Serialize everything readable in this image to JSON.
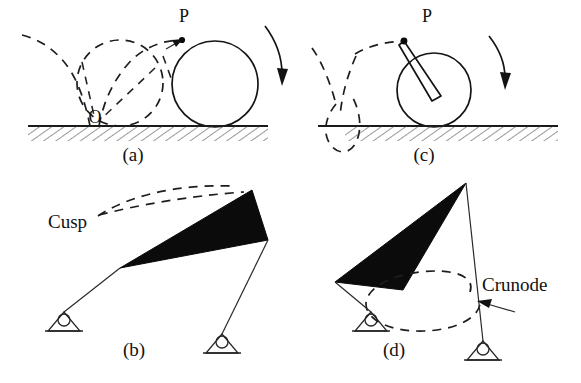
{
  "figure": {
    "background_color": "#ffffff",
    "ink_color": "#111111",
    "coupler_fill_color": "#0b0b0b"
  },
  "panels": [
    {
      "id": "a",
      "caption": "(a)",
      "caption_x": 133,
      "caption_y": 161,
      "kind": "rolling-circle-cycloid",
      "description": "Circle rolling on a straight ground line; tracing point P on the circle rim generates an ordinary cycloid with a cusp at the contact point O.",
      "labels": [
        {
          "name": "point-p",
          "text": "P",
          "x": 184,
          "y": 22
        },
        {
          "name": "point-o",
          "text": "O",
          "x": 95,
          "y": 123
        }
      ],
      "ground": {
        "y": 126,
        "x_start": 28,
        "x_end": 268
      },
      "rolling_circle": {
        "cx": 215,
        "cy": 84,
        "r": 43,
        "style": "solid"
      },
      "ghost_circle": {
        "cx": 120,
        "cy": 83,
        "r": 43,
        "style": "dashed"
      },
      "tracing_point": {
        "cx": 182,
        "cy": 40
      },
      "rotation_arrow": "clockwise"
    },
    {
      "id": "c",
      "caption": "(c)",
      "caption_x": 424,
      "caption_y": 161,
      "kind": "rolling-circle-prolate-trochoid",
      "description": "Circle rolling on the ground line with tracing point P carried on a rod outside the rim; the traced prolate trochoid forms a self-crossing loop (crunode) below the line.",
      "labels": [
        {
          "name": "point-p",
          "text": "P",
          "x": 427,
          "y": 22
        }
      ],
      "ground": {
        "y": 126,
        "x_start": 318,
        "x_end": 558
      },
      "rolling_circle": {
        "cx": 434,
        "cy": 90,
        "r": 37,
        "style": "solid"
      },
      "ghost_loop": {
        "cx": 340,
        "cy": 92,
        "rx": 26,
        "ry": 42,
        "style": "dashed"
      },
      "tracing_point": {
        "cx": 404,
        "cy": 41
      },
      "rod": {
        "x1": 404,
        "y1": 41,
        "x2": 436,
        "y2": 92
      },
      "rotation_arrow": "clockwise"
    },
    {
      "id": "b",
      "caption": "(b)",
      "caption_x": 134,
      "caption_y": 356,
      "kind": "fourbar-linkage-cusp",
      "description": "Four-bar linkage with a filled triangular coupler; the coupler point traces a curve having a cusp.",
      "labels": [
        {
          "name": "cusp-label",
          "text": "Cusp",
          "x": 48,
          "y": 228
        }
      ],
      "coupler_polygon": "120,268 252,190 268,240",
      "crank_left": {
        "x1": 120,
        "y1": 268,
        "x2": 64,
        "y2": 312
      },
      "crank_right": {
        "x1": 268,
        "y1": 240,
        "x2": 222,
        "y2": 334
      },
      "pivot_left": {
        "x": 64,
        "y": 312
      },
      "pivot_right": {
        "x": 222,
        "y": 334
      },
      "cusp_curve": "dashed arc pair meeting at a sharp point near the label"
    },
    {
      "id": "d",
      "caption": "(d)",
      "caption_x": 394,
      "caption_y": 356,
      "kind": "fourbar-linkage-crunode",
      "description": "Four-bar linkage with a filled triangular coupler; the coupler point traces a closed curve that crosses itself at a crunode.",
      "labels": [
        {
          "name": "crunode-label",
          "text": "Crunode",
          "x": 482,
          "y": 291
        }
      ],
      "coupler_polygon": "466,183 335,282 403,290",
      "crank_left": {
        "x1": 335,
        "y1": 282,
        "x2": 371,
        "y2": 312
      },
      "crank_right": {
        "x1": 466,
        "y1": 183,
        "x2": 483,
        "y2": 341
      },
      "pivot_left": {
        "x": 371,
        "y": 312
      },
      "pivot_right": {
        "x": 483,
        "y": 341
      },
      "crunode_loop": {
        "cx": 423,
        "cy": 305,
        "rx": 57,
        "ry": 29
      },
      "pointer_arrow": {
        "from_x": 513,
        "from_y": 311,
        "to_x": 478,
        "to_y": 302
      }
    }
  ]
}
